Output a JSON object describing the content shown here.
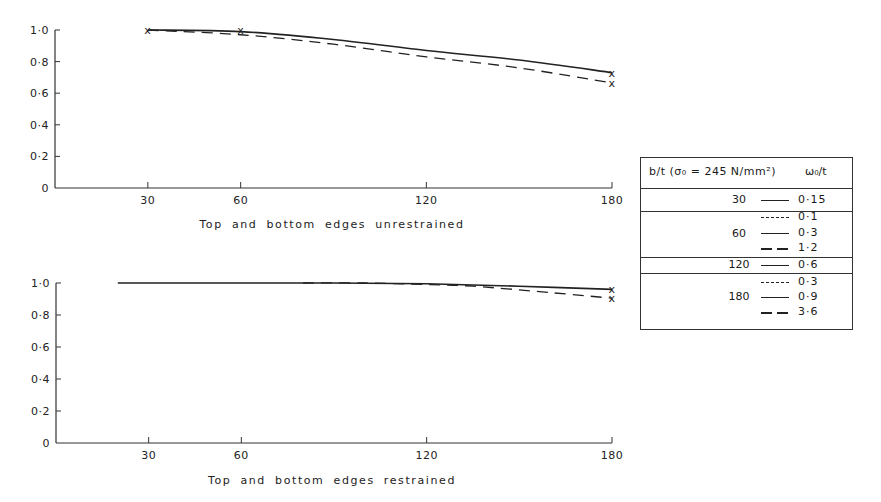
{
  "chart_data": [
    {
      "type": "line",
      "title": "Top and bottom edges unrestrained",
      "xlabel": "Top and bottom edges unrestrained",
      "ylabel": "",
      "xticks": [
        30,
        60,
        120,
        180
      ],
      "yticks": [
        "0",
        "0·2",
        "0·4",
        "0·6",
        "0·8",
        "1·0"
      ],
      "xlim": [
        0,
        180
      ],
      "ylim": [
        0,
        1.0
      ],
      "grid": false,
      "series": [
        {
          "name": "upper (solid) curve",
          "style": "solid",
          "x": [
            30,
            60,
            90,
            120,
            150,
            180
          ],
          "y": [
            1.0,
            0.99,
            0.94,
            0.87,
            0.81,
            0.73
          ]
        },
        {
          "name": "lower (dashed) curve",
          "style": "dashed",
          "x": [
            30,
            60,
            90,
            120,
            150,
            180
          ],
          "y": [
            1.0,
            0.97,
            0.91,
            0.83,
            0.76,
            0.665
          ]
        }
      ],
      "markers": [
        {
          "x": 30,
          "y": 1.0,
          "symbol": "x"
        },
        {
          "x": 60,
          "y": 1.0,
          "symbol": "x"
        },
        {
          "x": 180,
          "y": 0.73,
          "symbol": "x"
        },
        {
          "x": 180,
          "y": 0.665,
          "symbol": "x"
        }
      ]
    },
    {
      "type": "line",
      "title": "Top and bottom edges restrained",
      "xlabel": "Top and bottom edges restrained",
      "ylabel": "",
      "xticks": [
        30,
        60,
        120,
        180
      ],
      "yticks": [
        "0",
        "0·2",
        "0·4",
        "0·6",
        "0·8",
        "1·0"
      ],
      "xlim": [
        0,
        180
      ],
      "ylim": [
        0,
        1.0
      ],
      "grid": false,
      "series": [
        {
          "name": "upper (solid) curve",
          "style": "solid",
          "x": [
            20,
            60,
            90,
            120,
            150,
            180
          ],
          "y": [
            1.0,
            1.0,
            1.0,
            0.995,
            0.98,
            0.96
          ]
        },
        {
          "name": "lower (dashed) curve",
          "style": "dashed",
          "x": [
            80,
            100,
            120,
            135,
            160,
            180
          ],
          "y": [
            1.0,
            1.0,
            0.99,
            0.98,
            0.94,
            0.905
          ]
        }
      ],
      "markers": [
        {
          "x": 180,
          "y": 0.96,
          "symbol": "x"
        },
        {
          "x": 180,
          "y": 0.905,
          "symbol": "x"
        }
      ]
    }
  ],
  "legend": {
    "header_bt": "b/t (σ₀ = 245 N/mm²)",
    "header_w": "ω₀/t",
    "groups": [
      {
        "bt": "30",
        "entries": [
          {
            "style": "solid",
            "w": "0·15"
          }
        ]
      },
      {
        "bt": "60",
        "entries": [
          {
            "style": "dash-short",
            "w": "0·1"
          },
          {
            "style": "solid",
            "w": "0·3"
          },
          {
            "style": "dash-long",
            "w": "1·2"
          }
        ]
      },
      {
        "bt": "120",
        "entries": [
          {
            "style": "solid",
            "w": "0·6"
          }
        ]
      },
      {
        "bt": "180",
        "entries": [
          {
            "style": "dash-short",
            "w": "0·3"
          },
          {
            "style": "solid",
            "w": "0·9"
          },
          {
            "style": "dash-long",
            "w": "3·6"
          }
        ]
      }
    ]
  }
}
